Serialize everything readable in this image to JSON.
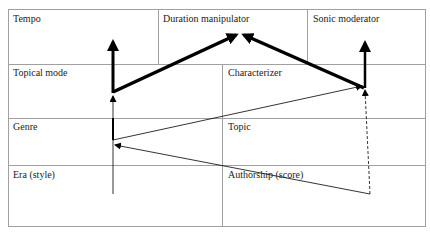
{
  "diagram": {
    "rows": [
      {
        "cells": [
          {
            "label": "Tempo"
          },
          {
            "label": "Duration manipulator"
          },
          {
            "label": "Sonic moderator"
          }
        ]
      },
      {
        "cells": [
          {
            "label": "Topical mode"
          },
          {
            "label": "Characterizer"
          }
        ]
      },
      {
        "cells": [
          {
            "label": "Genre"
          },
          {
            "label": "Topic"
          }
        ]
      },
      {
        "cells": [
          {
            "label": "Era (style)"
          },
          {
            "label": "Authorship (score)"
          }
        ]
      }
    ],
    "colors": {
      "grid": "#a0a0a0",
      "arrow": "#000000",
      "text": "#222222"
    }
  }
}
